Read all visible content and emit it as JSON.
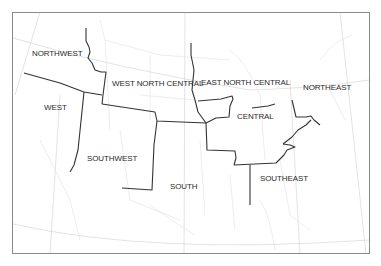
{
  "map": {
    "type": "US climate regions map",
    "colors": {
      "background": "#ffffff",
      "frame": "#8a8a8a",
      "region_border": "#333333",
      "state_border": "#d9d9d9",
      "graticule": "#c8c8c8",
      "label": "#2a2a2a"
    },
    "regions": [
      {
        "id": "northwest",
        "label": "NORTHWEST",
        "x": 32,
        "y": 53
      },
      {
        "id": "west",
        "label": "WEST",
        "x": 44,
        "y": 106
      },
      {
        "id": "west-north-central",
        "label": "WEST NORTH CENTRAL",
        "x": 112,
        "y": 81
      },
      {
        "id": "east-north-central",
        "label": "EAST NORTH CENTRAL",
        "x": 201,
        "y": 79
      },
      {
        "id": "northeast",
        "label": "NORTHEAST",
        "x": 303,
        "y": 84
      },
      {
        "id": "central",
        "label": "CENTRAL",
        "x": 238,
        "y": 114
      },
      {
        "id": "southwest",
        "label": "SOUTHWEST",
        "x": 87,
        "y": 157
      },
      {
        "id": "south",
        "label": "SOUTH",
        "x": 170,
        "y": 185
      },
      {
        "id": "southeast",
        "label": "SOUTHEAST",
        "x": 260,
        "y": 175
      }
    ]
  }
}
